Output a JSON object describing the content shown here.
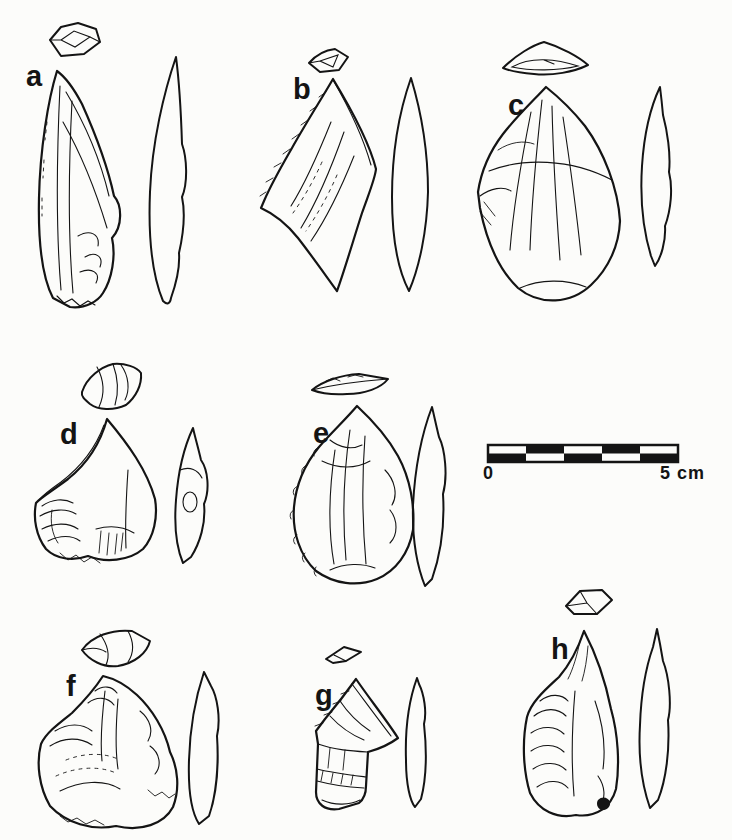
{
  "figure": {
    "ink_color": "#141414",
    "paper_color": "#fcfcfa",
    "specimens": [
      {
        "id": "a",
        "label": "a"
      },
      {
        "id": "b",
        "label": "b"
      },
      {
        "id": "c",
        "label": "c"
      },
      {
        "id": "d",
        "label": "d"
      },
      {
        "id": "e",
        "label": "e"
      },
      {
        "id": "f",
        "label": "f"
      },
      {
        "id": "g",
        "label": "g"
      },
      {
        "id": "h",
        "label": "h"
      }
    ],
    "scale_bar": {
      "start_label": "0",
      "end_label": "5 cm",
      "segments": 5,
      "rows": 2
    }
  }
}
